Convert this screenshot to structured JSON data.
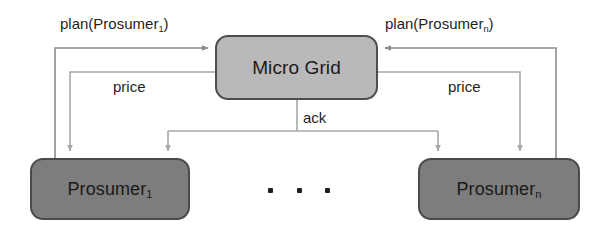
{
  "diagram": {
    "background_color": "#ffffff",
    "nodes": [
      {
        "id": "micro_grid",
        "label": "Micro Grid",
        "label_main": "Micro Grid",
        "label_sub": "",
        "fill_color": "#b9b9b9",
        "border_color": "#4d4d4d",
        "shape": "rounded-rectangle"
      },
      {
        "id": "prosumer_1",
        "label": "Prosumer1",
        "label_main": "Prosumer",
        "label_sub": "1",
        "fill_color": "#7d7d7d",
        "border_color": "#4a4a4a",
        "shape": "rounded-rectangle"
      },
      {
        "id": "prosumer_n",
        "label": "Prosumern",
        "label_main": "Prosumer",
        "label_sub": "n",
        "fill_color": "#7d7d7d",
        "border_color": "#4a4a4a",
        "shape": "rounded-rectangle"
      }
    ],
    "edges": [
      {
        "id": "plan_1",
        "label_main": "plan(Prosumer",
        "label_sub": "1",
        "label_tail": ")",
        "from": "prosumer_1",
        "to": "micro_grid",
        "line_color": "#8c8c8c"
      },
      {
        "id": "plan_n",
        "label_main": "plan(Prosumer",
        "label_sub": "n",
        "label_tail": ")",
        "from": "prosumer_n",
        "to": "micro_grid",
        "line_color": "#8c8c8c"
      },
      {
        "id": "price_left",
        "label_main": "price",
        "label_sub": "",
        "label_tail": "",
        "from": "micro_grid",
        "to": "prosumer_1",
        "line_color": "#a8a8a8"
      },
      {
        "id": "price_right",
        "label_main": "price",
        "label_sub": "",
        "label_tail": "",
        "from": "micro_grid",
        "to": "prosumer_n",
        "line_color": "#a8a8a8"
      },
      {
        "id": "ack",
        "label_main": "ack",
        "label_sub": "",
        "label_tail": "",
        "from": "micro_grid",
        "to": "prosumer_1, prosumer_n",
        "line_color": "#a8a8a8"
      }
    ],
    "ellipsis": {
      "dot_count": 3,
      "meaning": "additional prosumers omitted"
    }
  }
}
